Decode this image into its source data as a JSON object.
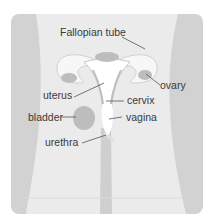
{
  "diagram": {
    "labels": {
      "fallopian_tube": "Fallopian tube",
      "ovary": "ovary",
      "uterus": "uterus",
      "cervix": "cervix",
      "bladder": "bladder",
      "vagina": "vagina",
      "urethra": "urethra"
    },
    "colors": {
      "background_panel": "#e6e6e6",
      "body_light": "#ededed",
      "body_dark": "#cfcfcf",
      "organ": "#bdbdbd",
      "cavity": "#ffffff",
      "text": "#3a3a3a",
      "leader": "#555555"
    }
  }
}
